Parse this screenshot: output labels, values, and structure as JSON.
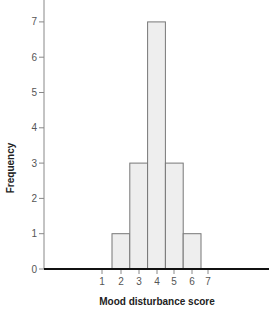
{
  "chart_data": {
    "type": "bar",
    "title": "",
    "xlabel": "Mood disturbance score",
    "ylabel": "Frequency",
    "categories": [
      "2",
      "3",
      "4",
      "5",
      "6"
    ],
    "values": [
      1,
      3,
      7,
      3,
      1
    ],
    "x_tick_labels": [
      "1",
      "2",
      "3",
      "4",
      "5",
      "6",
      "7"
    ],
    "y_tick_labels": [
      "0",
      "1",
      "2",
      "3",
      "4",
      "5",
      "6",
      "7"
    ],
    "ylim": [
      0,
      7.7
    ],
    "grid": false,
    "legend": null,
    "colors": {
      "bar_fill": "#eeeeee",
      "bar_stroke": "#777777",
      "axis": "#111111"
    }
  }
}
